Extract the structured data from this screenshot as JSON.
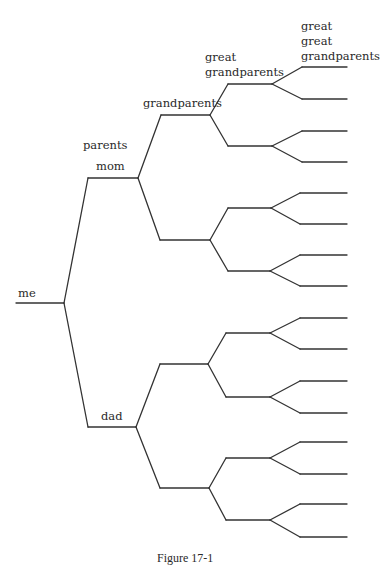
{
  "diagram": {
    "type": "family-tree",
    "stroke_color": "#333333",
    "background": "#ffffff",
    "labels": {
      "me": "me",
      "parents": "parents",
      "mom": "mom",
      "dad": "dad",
      "grandparents": "grandparents",
      "great_grandparents_1": "great",
      "great_grandparents_2": "grandparents",
      "gg_grandparents_1": "great",
      "gg_grandparents_2": "great",
      "gg_grandparents_3": "grandparents"
    },
    "caption": "Figure 17-1",
    "generations": [
      "me",
      "parents",
      "grandparents",
      "great grandparents",
      "great great grandparents"
    ],
    "nodes": [
      {
        "id": "me",
        "x1": 16,
        "x2": 64,
        "y": 303
      },
      {
        "id": "mom",
        "x1": 88,
        "x2": 138,
        "y": 178
      },
      {
        "id": "dad",
        "x1": 88,
        "x2": 136,
        "y": 427
      },
      {
        "id": "gp-mom-1",
        "x1": 161,
        "x2": 210,
        "y": 115
      },
      {
        "id": "gp-mom-2",
        "x1": 160,
        "x2": 210,
        "y": 240
      },
      {
        "id": "gp-dad-1",
        "x1": 160,
        "x2": 208,
        "y": 364
      },
      {
        "id": "gp-dad-2",
        "x1": 160,
        "x2": 209,
        "y": 488
      },
      {
        "id": "ggp-1",
        "x1": 228,
        "x2": 272,
        "y": 84
      },
      {
        "id": "ggp-2",
        "x1": 228,
        "x2": 272,
        "y": 146
      },
      {
        "id": "ggp-3",
        "x1": 228,
        "x2": 271,
        "y": 208
      },
      {
        "id": "ggp-4",
        "x1": 228,
        "x2": 270,
        "y": 271
      },
      {
        "id": "ggp-5",
        "x1": 226,
        "x2": 270,
        "y": 333
      },
      {
        "id": "ggp-6",
        "x1": 226,
        "x2": 270,
        "y": 397
      },
      {
        "id": "ggp-7",
        "x1": 226,
        "x2": 270,
        "y": 458
      },
      {
        "id": "ggp-8",
        "x1": 226,
        "x2": 270,
        "y": 520
      },
      {
        "id": "gggp-1",
        "x1": 302,
        "x2": 347,
        "y": 67
      },
      {
        "id": "gggp-2",
        "x1": 302,
        "x2": 347,
        "y": 99
      },
      {
        "id": "gggp-3",
        "x1": 302,
        "x2": 347,
        "y": 131
      },
      {
        "id": "gggp-4",
        "x1": 302,
        "x2": 347,
        "y": 162
      },
      {
        "id": "gggp-5",
        "x1": 300,
        "x2": 347,
        "y": 193
      },
      {
        "id": "gggp-6",
        "x1": 300,
        "x2": 347,
        "y": 224
      },
      {
        "id": "gggp-7",
        "x1": 300,
        "x2": 347,
        "y": 255
      },
      {
        "id": "gggp-8",
        "x1": 300,
        "x2": 347,
        "y": 286
      },
      {
        "id": "gggp-9",
        "x1": 300,
        "x2": 347,
        "y": 318
      },
      {
        "id": "gggp-10",
        "x1": 300,
        "x2": 347,
        "y": 349
      },
      {
        "id": "gggp-11",
        "x1": 300,
        "x2": 347,
        "y": 381
      },
      {
        "id": "gggp-12",
        "x1": 300,
        "x2": 347,
        "y": 413
      },
      {
        "id": "gggp-13",
        "x1": 300,
        "x2": 347,
        "y": 442
      },
      {
        "id": "gggp-14",
        "x1": 300,
        "x2": 347,
        "y": 474
      },
      {
        "id": "gggp-15",
        "x1": 300,
        "x2": 347,
        "y": 504
      },
      {
        "id": "gggp-16",
        "x1": 300,
        "x2": 347,
        "y": 537
      }
    ],
    "edges": [
      [
        "me",
        "mom"
      ],
      [
        "me",
        "dad"
      ],
      [
        "mom",
        "gp-mom-1"
      ],
      [
        "mom",
        "gp-mom-2"
      ],
      [
        "dad",
        "gp-dad-1"
      ],
      [
        "dad",
        "gp-dad-2"
      ],
      [
        "gp-mom-1",
        "ggp-1"
      ],
      [
        "gp-mom-1",
        "ggp-2"
      ],
      [
        "gp-mom-2",
        "ggp-3"
      ],
      [
        "gp-mom-2",
        "ggp-4"
      ],
      [
        "gp-dad-1",
        "ggp-5"
      ],
      [
        "gp-dad-1",
        "ggp-6"
      ],
      [
        "gp-dad-2",
        "ggp-7"
      ],
      [
        "gp-dad-2",
        "ggp-8"
      ],
      [
        "ggp-1",
        "gggp-1"
      ],
      [
        "ggp-1",
        "gggp-2"
      ],
      [
        "ggp-2",
        "gggp-3"
      ],
      [
        "ggp-2",
        "gggp-4"
      ],
      [
        "ggp-3",
        "gggp-5"
      ],
      [
        "ggp-3",
        "gggp-6"
      ],
      [
        "ggp-4",
        "gggp-7"
      ],
      [
        "ggp-4",
        "gggp-8"
      ],
      [
        "ggp-5",
        "gggp-9"
      ],
      [
        "ggp-5",
        "gggp-10"
      ],
      [
        "ggp-6",
        "gggp-11"
      ],
      [
        "ggp-6",
        "gggp-12"
      ],
      [
        "ggp-7",
        "gggp-13"
      ],
      [
        "ggp-7",
        "gggp-14"
      ],
      [
        "ggp-8",
        "gggp-15"
      ],
      [
        "ggp-8",
        "gggp-16"
      ]
    ]
  }
}
